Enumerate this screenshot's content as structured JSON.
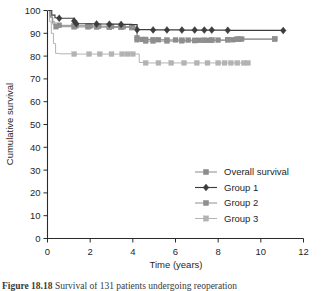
{
  "figure": {
    "caption_prefix": "Figure  18.18",
    "caption_rest": "Survival of 131 patients undergoing reoperation",
    "caption_visible": "partially-cropped"
  },
  "axes": {
    "x_title": "Time (years)",
    "y_title": "Cumulative survival",
    "x_ticks": [
      "0",
      "2",
      "4",
      "6",
      "8",
      "10",
      "12"
    ],
    "y_ticks": [
      "0",
      "10",
      "20",
      "30",
      "40",
      "50",
      "60",
      "70",
      "80",
      "90",
      "100"
    ]
  },
  "legend": {
    "position": "inside-lower-right",
    "items": [
      {
        "label": "Overall survival",
        "marker": "square",
        "color": "#8c8c8c"
      },
      {
        "label": "Group 1",
        "marker": "diamond",
        "color": "#3d3d3d"
      },
      {
        "label": "Group 2",
        "marker": "square",
        "color": "#8f8f8f"
      },
      {
        "label": "Group 3",
        "marker": "square",
        "color": "#b3b3b3"
      }
    ]
  },
  "chart_data": {
    "type": "line",
    "subtype": "kaplan-meier-step",
    "title": "",
    "xlabel": "Time (years)",
    "ylabel": "Cumulative survival",
    "xlim": [
      0,
      12
    ],
    "ylim": [
      0,
      100
    ],
    "xticks": [
      0,
      2,
      4,
      6,
      8,
      10,
      12
    ],
    "yticks": [
      0,
      10,
      20,
      30,
      40,
      50,
      60,
      70,
      80,
      90,
      100
    ],
    "grid": false,
    "legend_position": "lower right (inside axes)",
    "series": [
      {
        "name": "Overall survival",
        "marker": "square",
        "color": "#8c8c8c",
        "steps": [
          [
            0.0,
            100.0
          ],
          [
            0.12,
            97.5
          ],
          [
            0.22,
            95.0
          ],
          [
            0.35,
            93.8
          ],
          [
            0.55,
            93.5
          ],
          [
            1.25,
            93.3
          ],
          [
            1.9,
            93.2
          ],
          [
            2.3,
            93.1
          ],
          [
            2.9,
            93.0
          ],
          [
            3.45,
            92.9
          ],
          [
            3.95,
            92.8
          ],
          [
            4.2,
            88.0
          ],
          [
            4.45,
            87.3
          ],
          [
            4.95,
            87.2
          ],
          [
            5.6,
            87.1
          ],
          [
            6.3,
            87.0
          ],
          [
            6.9,
            86.9
          ],
          [
            7.35,
            86.9
          ],
          [
            7.7,
            87.0
          ],
          [
            8.45,
            87.2
          ],
          [
            8.9,
            87.4
          ],
          [
            9.1,
            87.5
          ],
          [
            10.65,
            87.5
          ]
        ],
        "markers_x": [
          0.55,
          1.25,
          1.35,
          1.9,
          2.0,
          2.3,
          2.4,
          2.9,
          3.0,
          3.45,
          3.55,
          3.95,
          4.2,
          4.45,
          4.6,
          4.95,
          5.2,
          5.6,
          6.0,
          6.3,
          6.6,
          6.9,
          7.1,
          7.35,
          7.55,
          7.7,
          8.0,
          8.45,
          8.7,
          8.9,
          9.0,
          9.1,
          10.65
        ]
      },
      {
        "name": "Group 1",
        "marker": "diamond",
        "color": "#3d3d3d",
        "steps": [
          [
            0.0,
            100.0
          ],
          [
            0.2,
            98.0
          ],
          [
            0.35,
            96.8
          ],
          [
            0.55,
            96.6
          ],
          [
            1.25,
            95.4
          ],
          [
            1.35,
            94.2
          ],
          [
            2.3,
            94.1
          ],
          [
            2.9,
            94.0
          ],
          [
            3.45,
            93.9
          ],
          [
            3.95,
            93.8
          ],
          [
            4.2,
            91.6
          ],
          [
            4.95,
            91.5
          ],
          [
            5.6,
            91.5
          ],
          [
            6.3,
            91.4
          ],
          [
            6.9,
            91.4
          ],
          [
            7.35,
            91.4
          ],
          [
            7.7,
            91.4
          ],
          [
            8.45,
            91.3
          ],
          [
            11.05,
            91.2
          ]
        ],
        "markers_x": [
          0.55,
          1.25,
          1.35,
          2.3,
          2.9,
          3.45,
          4.2,
          4.95,
          5.6,
          6.3,
          6.9,
          7.35,
          7.7,
          8.45,
          11.05
        ]
      },
      {
        "name": "Group 2",
        "marker": "square",
        "color": "#8f8f8f",
        "steps": [
          [
            0.0,
            100.0
          ],
          [
            0.12,
            97.0
          ],
          [
            0.25,
            94.0
          ],
          [
            0.4,
            92.9
          ],
          [
            1.25,
            92.8
          ],
          [
            1.9,
            92.8
          ],
          [
            2.3,
            92.7
          ],
          [
            2.9,
            92.6
          ],
          [
            3.45,
            92.6
          ],
          [
            3.95,
            92.5
          ],
          [
            4.2,
            87.2
          ],
          [
            4.6,
            86.6
          ],
          [
            4.95,
            86.6
          ],
          [
            5.6,
            86.6
          ],
          [
            6.3,
            86.7
          ],
          [
            6.9,
            86.8
          ],
          [
            7.35,
            86.9
          ],
          [
            7.7,
            87.0
          ],
          [
            8.45,
            87.2
          ],
          [
            8.9,
            87.4
          ],
          [
            10.65,
            87.5
          ]
        ],
        "markers_x": [
          0.4,
          1.25,
          1.9,
          2.3,
          2.9,
          3.45,
          3.95,
          4.2,
          4.6,
          4.95,
          5.6,
          6.3,
          6.9,
          7.35,
          7.7,
          8.45,
          8.9,
          10.65
        ]
      },
      {
        "name": "Group 3",
        "marker": "square",
        "color": "#b3b3b3",
        "steps": [
          [
            0.0,
            100.0
          ],
          [
            0.1,
            95.0
          ],
          [
            0.18,
            90.0
          ],
          [
            0.28,
            85.5
          ],
          [
            0.38,
            81.2
          ],
          [
            0.55,
            81.0
          ],
          [
            1.25,
            80.9
          ],
          [
            1.95,
            80.9
          ],
          [
            2.45,
            80.9
          ],
          [
            3.0,
            80.9
          ],
          [
            3.5,
            80.9
          ],
          [
            4.0,
            80.9
          ],
          [
            4.3,
            77.2
          ],
          [
            4.6,
            77.0
          ],
          [
            5.2,
            77.0
          ],
          [
            5.8,
            77.0
          ],
          [
            6.4,
            77.0
          ],
          [
            7.0,
            77.0
          ],
          [
            7.5,
            77.0
          ],
          [
            8.0,
            77.0
          ],
          [
            8.5,
            77.0
          ],
          [
            9.0,
            77.0
          ],
          [
            9.4,
            77.0
          ]
        ],
        "markers_x": [
          1.25,
          1.95,
          2.45,
          3.0,
          3.5,
          3.75,
          4.0,
          4.6,
          5.2,
          5.8,
          6.4,
          7.0,
          7.5,
          8.0,
          8.3,
          8.6,
          8.9,
          9.2,
          9.4
        ]
      }
    ]
  }
}
